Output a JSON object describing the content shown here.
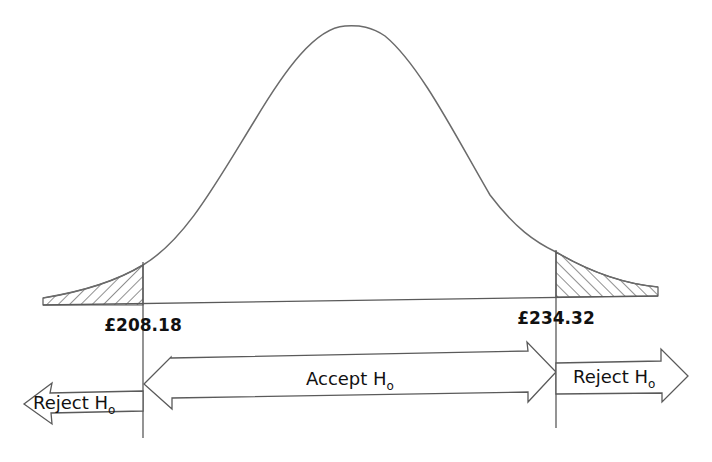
{
  "diagram": {
    "type": "normal-distribution-hypothesis-test",
    "colors": {
      "curve": "#6b6b6b",
      "lines": "#5a5a5a",
      "hatch": "#444444",
      "text": "#111111",
      "background": "#ffffff"
    },
    "critical_values": {
      "lower": {
        "label": "£208.18",
        "value": 208.18
      },
      "upper": {
        "label": "£234.32",
        "value": 234.32
      }
    },
    "regions": {
      "reject_left": {
        "main": "Reject H",
        "subscript": "o"
      },
      "accept": {
        "main": "Accept H",
        "subscript": "o"
      },
      "reject_right": {
        "main": "Reject H",
        "subscript": "o"
      }
    },
    "tails": {
      "left": {
        "shaded": true,
        "pattern": "diagonal-hatch"
      },
      "right": {
        "shaded": true,
        "pattern": "diagonal-hatch"
      }
    }
  }
}
